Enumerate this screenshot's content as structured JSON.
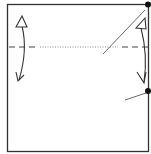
{
  "diagram": {
    "type": "origami-fold-step",
    "colors": {
      "line": "#333333",
      "background": "#ffffff",
      "dash": "#444444",
      "dot_line": "#777777"
    },
    "paper": {
      "x": 7,
      "y": 4,
      "width": 141,
      "height": 147
    },
    "valley_fold_line": {
      "y": 47,
      "style": "dashed"
    },
    "hidden_crease": {
      "x1": 40,
      "x2": 118,
      "y": 47,
      "style": "dotted"
    },
    "reference_points": [
      {
        "x": 148,
        "y": 4
      },
      {
        "x": 148,
        "y": 91
      }
    ],
    "leader_lines": [
      {
        "x1": 145,
        "y1": 10,
        "x2": 103,
        "y2": 54
      },
      {
        "x1": 146,
        "y1": 93,
        "x2": 125,
        "y2": 100
      }
    ],
    "arrows": [
      {
        "side": "left",
        "description": "fold and unfold arrow"
      },
      {
        "side": "right",
        "description": "fold and unfold arrow"
      }
    ]
  }
}
